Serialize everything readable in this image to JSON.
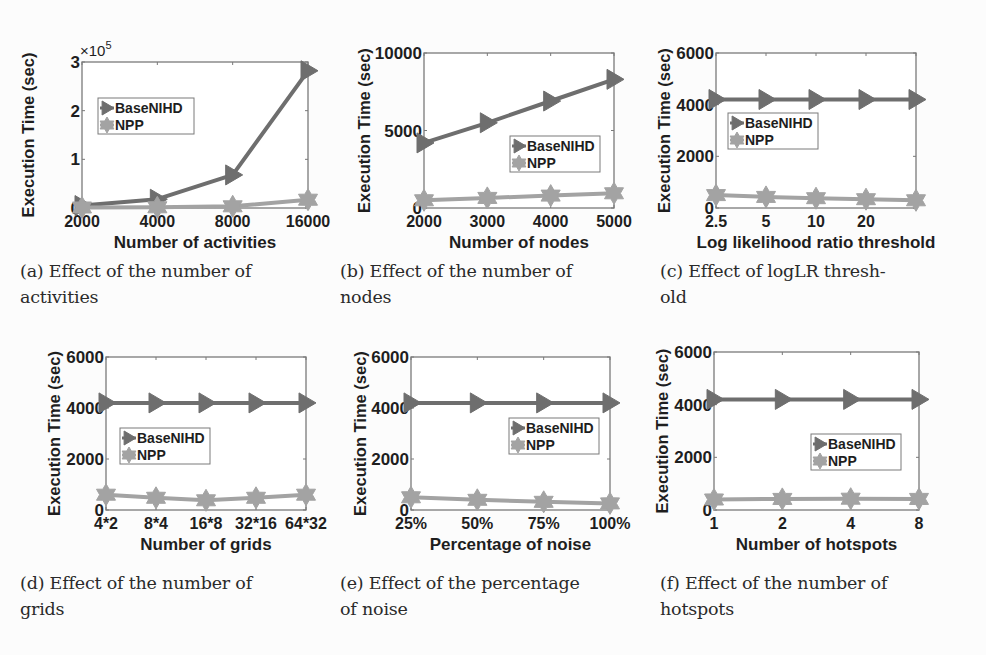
{
  "figure": {
    "colors": {
      "basenihd": "#6e6e6e",
      "npp": "#a3a3a3",
      "axis": "#7a7a7a",
      "text": "#1e1e1e",
      "background": "#fcfcfc"
    },
    "legend_labels": [
      "BaseNIHD",
      "NPP"
    ]
  },
  "captions": [
    {
      "id": "a",
      "line1": "(a) Effect of the number of",
      "line2": "activities"
    },
    {
      "id": "b",
      "line1": "(b) Effect of the number of",
      "line2": "nodes"
    },
    {
      "id": "c",
      "line1": "(c) Effect of logLR thresh-",
      "line2": "old"
    },
    {
      "id": "d",
      "line1": "(d) Effect of the number of",
      "line2": "grids"
    },
    {
      "id": "e",
      "line1": "(e) Effect of the percentage",
      "line2": "of noise"
    },
    {
      "id": "f",
      "line1": "(f) Effect of the number of",
      "line2": "hotspots"
    }
  ],
  "chart_data": [
    {
      "id": "a",
      "type": "line",
      "title": "",
      "xlabel": "Number of activities",
      "ylabel": "Execution Time (sec)",
      "x": [
        "2000",
        "4000",
        "8000",
        "16000"
      ],
      "x_tick_labels": [
        "2000",
        "4000",
        "8000",
        "16000"
      ],
      "y_ticks": [
        0,
        100000,
        200000,
        300000
      ],
      "y_tick_labels": [
        "0",
        "1",
        "2",
        "3"
      ],
      "y_exponent_label": "×10^5",
      "ylim": [
        0,
        300000
      ],
      "legend_position": "upper left",
      "series": [
        {
          "name": "BaseNIHD",
          "marker": "triangle-right",
          "values": [
            5000,
            18000,
            68000,
            282000
          ]
        },
        {
          "name": "NPP",
          "marker": "hexagram",
          "values": [
            1000,
            1500,
            3500,
            17000
          ]
        }
      ]
    },
    {
      "id": "b",
      "type": "line",
      "title": "",
      "xlabel": "Number of nodes",
      "ylabel": "Execution Time (sec)",
      "x": [
        "2000",
        "3000",
        "4000",
        "5000"
      ],
      "x_tick_labels": [
        "2000",
        "3000",
        "4000",
        "5000"
      ],
      "y_ticks": [
        0,
        5000,
        10000
      ],
      "y_tick_labels": [
        "0",
        "5000",
        "10000"
      ],
      "ylim": [
        0,
        10000
      ],
      "legend_position": "lower right",
      "series": [
        {
          "name": "BaseNIHD",
          "marker": "triangle-right",
          "values": [
            4200,
            5500,
            6900,
            8300
          ]
        },
        {
          "name": "NPP",
          "marker": "hexagram",
          "values": [
            500,
            650,
            800,
            950
          ]
        }
      ]
    },
    {
      "id": "c",
      "type": "line",
      "title": "",
      "xlabel": "Log likelihood ratio threshold",
      "ylabel": "Execution Time (sec)",
      "x": [
        "2.5",
        "5",
        "10",
        "20",
        ""
      ],
      "x_tick_labels": [
        "2.5",
        "5",
        "10",
        "20",
        ""
      ],
      "y_ticks": [
        0,
        2000,
        4000,
        6000
      ],
      "y_tick_labels": [
        "0",
        "2000",
        "4000",
        "6000"
      ],
      "ylim": [
        0,
        6000
      ],
      "legend_position": "upper left",
      "series": [
        {
          "name": "BaseNIHD",
          "marker": "triangle-right",
          "values": [
            4200,
            4200,
            4200,
            4200,
            4200
          ]
        },
        {
          "name": "NPP",
          "marker": "hexagram",
          "values": [
            500,
            430,
            380,
            340,
            300
          ]
        }
      ]
    },
    {
      "id": "d",
      "type": "line",
      "title": "",
      "xlabel": "Number of grids",
      "ylabel": "Execution Time (sec)",
      "x": [
        "4*2",
        "8*4",
        "16*8",
        "32*16",
        "64*32"
      ],
      "x_tick_labels": [
        "4*2",
        "8*4",
        "16*8",
        "32*16",
        "64*32"
      ],
      "y_ticks": [
        0,
        2000,
        4000,
        6000
      ],
      "y_tick_labels": [
        "0",
        "2000",
        "4000",
        "6000"
      ],
      "ylim": [
        0,
        6000
      ],
      "legend_position": "center left",
      "series": [
        {
          "name": "BaseNIHD",
          "marker": "triangle-right",
          "values": [
            4200,
            4200,
            4200,
            4200,
            4200
          ]
        },
        {
          "name": "NPP",
          "marker": "hexagram",
          "values": [
            600,
            480,
            380,
            480,
            600
          ]
        }
      ]
    },
    {
      "id": "e",
      "type": "line",
      "title": "",
      "xlabel": "Percentage of noise",
      "ylabel": "Execution Time (sec)",
      "x": [
        "25%",
        "50%",
        "75%",
        "100%"
      ],
      "x_tick_labels": [
        "25%",
        "50%",
        "75%",
        "100%"
      ],
      "y_ticks": [
        0,
        2000,
        4000,
        6000
      ],
      "y_tick_labels": [
        "0",
        "2000",
        "4000",
        "6000"
      ],
      "ylim": [
        0,
        6000
      ],
      "legend_position": "center right",
      "series": [
        {
          "name": "BaseNIHD",
          "marker": "triangle-right",
          "values": [
            4200,
            4200,
            4200,
            4200
          ]
        },
        {
          "name": "NPP",
          "marker": "hexagram",
          "values": [
            500,
            400,
            320,
            260
          ]
        }
      ]
    },
    {
      "id": "f",
      "type": "line",
      "title": "",
      "xlabel": "Number of hotspots",
      "ylabel": "Execution Time (sec)",
      "x": [
        "1",
        "2",
        "4",
        "8"
      ],
      "x_tick_labels": [
        "1",
        "2",
        "4",
        "8"
      ],
      "y_ticks": [
        0,
        2000,
        4000,
        6000
      ],
      "y_tick_labels": [
        "0",
        "2000",
        "4000",
        "6000"
      ],
      "ylim": [
        0,
        6000
      ],
      "legend_position": "center right",
      "series": [
        {
          "name": "BaseNIHD",
          "marker": "triangle-right",
          "values": [
            4200,
            4200,
            4200,
            4200
          ]
        },
        {
          "name": "NPP",
          "marker": "hexagram",
          "values": [
            400,
            420,
            430,
            420
          ]
        }
      ]
    }
  ]
}
